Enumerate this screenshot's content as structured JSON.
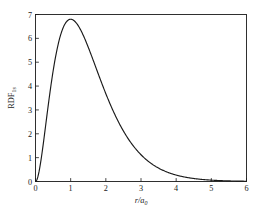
{
  "chart_data": {
    "type": "line",
    "title": "",
    "subtitle": "",
    "xlabel": "r/a",
    "xlabel_sub": "0",
    "ylabel": "RDF",
    "ylabel_sub": "1s",
    "xlim": [
      0,
      6
    ],
    "ylim": [
      0,
      7
    ],
    "xticks": [
      0,
      1,
      2,
      3,
      4,
      5,
      6
    ],
    "xtick_labels": [
      "0",
      "1",
      "2",
      "3",
      "4",
      "5",
      "6"
    ],
    "yticks": [
      0,
      1,
      2,
      3,
      4,
      5,
      6,
      7
    ],
    "ytick_labels": [
      "0",
      "1",
      "2",
      "3",
      "4",
      "5",
      "6",
      "7"
    ],
    "grid": false,
    "legend": "none",
    "tick_direction": "in",
    "frame": "box",
    "series": [
      {
        "name": "RDF 1s",
        "color": "#1a1a1a",
        "linewidth": 1.15,
        "peak_x": 1.0,
        "peak_y": 6.8,
        "x": [
          0.0,
          0.05,
          0.1,
          0.15,
          0.2,
          0.25,
          0.3,
          0.35,
          0.4,
          0.45,
          0.5,
          0.55,
          0.6,
          0.65,
          0.7,
          0.75,
          0.8,
          0.85,
          0.9,
          0.95,
          1.0,
          1.05,
          1.1,
          1.15,
          1.2,
          1.25,
          1.3,
          1.35,
          1.4,
          1.45,
          1.5,
          1.6,
          1.7,
          1.8,
          1.9,
          2.0,
          2.1,
          2.2,
          2.3,
          2.4,
          2.5,
          2.6,
          2.7,
          2.8,
          2.9,
          3.0,
          3.2,
          3.4,
          3.6,
          3.8,
          4.0,
          4.2,
          4.4,
          4.6,
          4.8,
          5.0,
          5.2,
          5.4,
          5.6,
          5.8,
          6.0
        ],
        "y": [
          0.0,
          0.111,
          0.422,
          0.9,
          1.51,
          2.211,
          2.964,
          3.734,
          4.49,
          5.208,
          5.869,
          6.459,
          6.969,
          7.392,
          7.727,
          7.974,
          8.136,
          8.219,
          8.229,
          8.175,
          8.064,
          7.904,
          7.704,
          7.471,
          7.211,
          6.93,
          6.635,
          6.33,
          6.019,
          5.707,
          5.396,
          4.791,
          4.222,
          3.696,
          3.218,
          2.789,
          2.407,
          2.07,
          1.773,
          1.514,
          1.288,
          1.093,
          0.925,
          0.781,
          0.657,
          0.552,
          0.387,
          0.269,
          0.186,
          0.128,
          0.087,
          0.059,
          0.04,
          0.027,
          0.018,
          0.012,
          0.008,
          0.005,
          0.004,
          0.002,
          0.001
        ],
        "note": "4 r^2 exp(-2r) scaled so the maximum at r/a0 = 1 equals 6.8"
      }
    ]
  },
  "figure": {
    "background_color": "#ffffff",
    "axis_color": "#1a1a1a"
  }
}
